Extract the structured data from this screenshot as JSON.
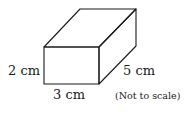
{
  "diagram": {
    "shape": "rectangular-prism",
    "stroke_color": "#1a1a1a",
    "labels": {
      "height": "2 cm",
      "width": "3 cm",
      "depth": "5 cm",
      "note": "(Not to scale)"
    }
  }
}
